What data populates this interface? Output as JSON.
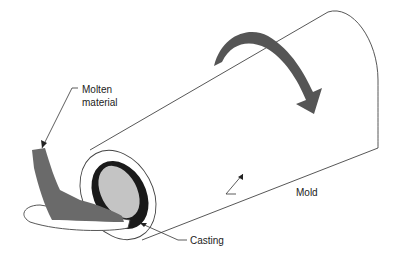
{
  "diagram": {
    "labels": {
      "molten_material_line1": "Molten",
      "molten_material_line2": "material",
      "mold": "Mold",
      "casting": "Casting"
    },
    "colors": {
      "outline": "#444444",
      "rotation_arrow": "#555555",
      "molten": "#6a6a6a",
      "casting_ring": "#1a1a1a",
      "core": "#c4c4c4"
    }
  }
}
